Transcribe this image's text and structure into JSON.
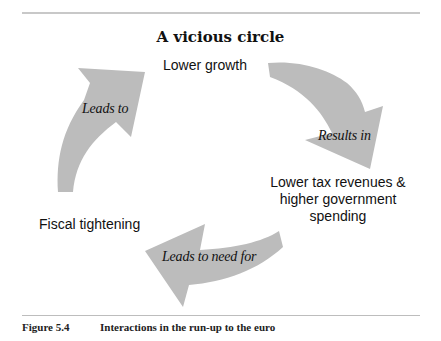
{
  "diagram": {
    "title": "A vicious circle",
    "nodes": {
      "lower_growth": "Lower growth",
      "tax_revenues": {
        "line1": "Lower tax revenues &",
        "line2": "higher government",
        "line3": "spending"
      },
      "fiscal_tightening": "Fiscal tightening"
    },
    "edges": {
      "growth_to_tax": "Results in",
      "tax_to_fiscal": "Leads to need for",
      "fiscal_to_growth": "Leads to"
    },
    "colors": {
      "arrow_fill": "#bcbcbc",
      "rule": "#bdbdbd",
      "text": "#111111"
    }
  },
  "caption": {
    "figure_number": "Figure 5.4",
    "text": "Interactions in the run-up to the euro"
  }
}
